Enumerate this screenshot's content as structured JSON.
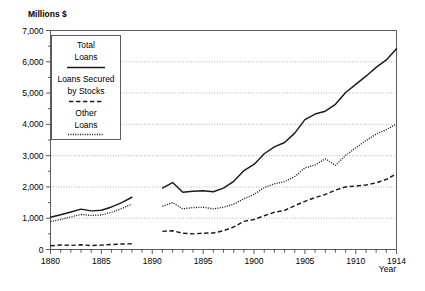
{
  "chart_data": {
    "type": "line",
    "title": "",
    "subtitle": "",
    "xlabel": "Year",
    "ylabel": "Millions $",
    "unit_label": "Millions $",
    "xlim": [
      1880,
      1914
    ],
    "ylim": [
      0,
      7000
    ],
    "grid": true,
    "grid_axis": "y",
    "legend_position": "inside-upper-left",
    "y_ticks_major": [
      0,
      1000,
      2000,
      3000,
      4000,
      5000,
      6000,
      7000
    ],
    "y_tick_labels": [
      "0",
      "1,000",
      "2,000",
      "3,000",
      "4,000",
      "5,000",
      "6,000",
      "7,000"
    ],
    "y_ticks_minor": [
      500,
      1500,
      2500,
      3500,
      4500,
      5500,
      6500
    ],
    "x_ticks_major": [
      1880,
      1885,
      1890,
      1895,
      1900,
      1905,
      1910,
      1914
    ],
    "x_tick_labels": [
      "1880",
      "1885",
      "1890",
      "1895",
      "1900",
      "1905",
      "1910",
      "1914"
    ],
    "x_ticks_minor_step": 1,
    "series": [
      {
        "name": "Total Loans",
        "legend_label_line1": "Total",
        "legend_label_line2": "Loans",
        "style": "solid",
        "color": "#1b1b1b",
        "segments": [
          {
            "x": [
              1880,
              1881,
              1882,
              1883,
              1884,
              1885,
              1886,
              1887,
              1888
            ],
            "y": [
              1030,
              1110,
              1200,
              1290,
              1235,
              1255,
              1360,
              1500,
              1670
            ]
          },
          {
            "x": [
              1891,
              1892,
              1893,
              1894,
              1895,
              1896,
              1897,
              1898,
              1899,
              1900,
              1901,
              1902,
              1903,
              1904,
              1905,
              1906,
              1907,
              1908,
              1909,
              1910,
              1911,
              1912,
              1913,
              1914
            ],
            "y": [
              1965,
              2140,
              1830,
              1860,
              1880,
              1845,
              1960,
              2180,
              2520,
              2720,
              3060,
              3280,
              3420,
              3720,
              4150,
              4330,
              4420,
              4640,
              5020,
              5280,
              5540,
              5820,
              6060,
              6420
            ]
          }
        ]
      },
      {
        "name": "Loans Secured by Stocks",
        "legend_label_line1": "Loans Secured",
        "legend_label_line2": "by Stocks",
        "style": "dashed",
        "color": "#1b1b1b",
        "segments": [
          {
            "x": [
              1880,
              1881,
              1882,
              1883,
              1884,
              1885,
              1886,
              1887,
              1888
            ],
            "y": [
              120,
              145,
              130,
              150,
              125,
              140,
              160,
              175,
              185
            ]
          },
          {
            "x": [
              1891,
              1892,
              1893,
              1894,
              1895,
              1896,
              1897,
              1898,
              1899,
              1900,
              1901,
              1902,
              1903,
              1904,
              1905,
              1906,
              1907,
              1908,
              1909,
              1910,
              1911,
              1912,
              1913,
              1914
            ],
            "y": [
              580,
              600,
              520,
              500,
              520,
              530,
              600,
              720,
              900,
              960,
              1080,
              1190,
              1250,
              1400,
              1540,
              1660,
              1760,
              1900,
              2000,
              2030,
              2060,
              2130,
              2240,
              2420
            ]
          }
        ]
      },
      {
        "name": "Other Loans",
        "legend_label_line1": "Other",
        "legend_label_line2": "Loans",
        "style": "dotted",
        "color": "#1b1b1b",
        "segments": [
          {
            "x": [
              1880,
              1881,
              1882,
              1883,
              1884,
              1885,
              1886,
              1887,
              1888
            ],
            "y": [
              890,
              960,
              1040,
              1120,
              1090,
              1105,
              1190,
              1310,
              1450
            ]
          },
          {
            "x": [
              1891,
              1892,
              1893,
              1894,
              1895,
              1896,
              1897,
              1898,
              1899,
              1900,
              1901,
              1902,
              1903,
              1904,
              1905,
              1906,
              1907,
              1908,
              1909,
              1910,
              1911,
              1912,
              1913,
              1914
            ],
            "y": [
              1380,
              1500,
              1300,
              1340,
              1350,
              1300,
              1350,
              1450,
              1620,
              1760,
              1980,
              2100,
              2170,
              2330,
              2610,
              2700,
              2900,
              2690,
              3010,
              3250,
              3480,
              3690,
              3830,
              4010
            ]
          }
        ]
      }
    ]
  },
  "legend": {
    "entries": [
      {
        "label_line1": "Total",
        "label_line2": "Loans",
        "swatch": "solid-line-swatch"
      },
      {
        "label_line1": "Loans Secured",
        "label_line2": "by Stocks",
        "swatch": "dashed-line-swatch"
      },
      {
        "label_line1": "Other",
        "label_line2": "Loans",
        "swatch": "dotted-line-swatch"
      }
    ]
  }
}
